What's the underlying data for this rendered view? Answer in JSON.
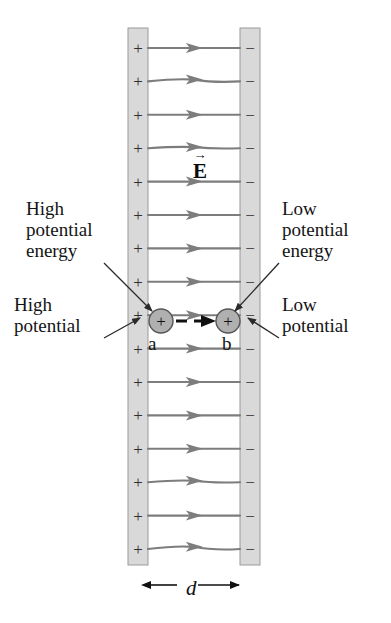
{
  "figure": {
    "width": 391,
    "height": 623,
    "background": "#ffffff"
  },
  "colors": {
    "plate_fill": "#d9d9d9",
    "plate_stroke": "#9a9a9a",
    "field_line": "#7d7d7d",
    "charge_fill": "#b0b0b0",
    "charge_stroke": "#555555",
    "leader_line": "#2a2a2a",
    "text": "#141414",
    "motion_arrow": "#111111"
  },
  "plates": {
    "left": {
      "name": "positive-plate",
      "x": 128,
      "y": 28,
      "width": 20,
      "height": 537,
      "sign": "+",
      "sign_count": 16
    },
    "right": {
      "name": "negative-plate",
      "x": 240,
      "y": 28,
      "width": 20,
      "height": 537,
      "sign": "−",
      "sign_count": 16
    }
  },
  "field": {
    "label": "E",
    "vector_accent": "→",
    "label_x": 193,
    "label_y": 152,
    "line_count": 16,
    "line_top": 48,
    "line_spacing": 33.4,
    "line_x_start": 148,
    "line_x_end": 240,
    "direction": "left-to-right"
  },
  "charges": [
    {
      "name": "charge-at-a",
      "sign": "+",
      "cx": 161,
      "cy": 321,
      "r": 12,
      "point_label": "a",
      "point_label_x": 148,
      "point_label_y": 333
    },
    {
      "name": "charge-at-b",
      "sign": "+",
      "cx": 228,
      "cy": 321,
      "r": 12,
      "point_label": "b",
      "point_label_x": 222,
      "point_label_y": 333
    }
  ],
  "motion_arrow": {
    "name": "displacement-arrow",
    "x1": 176,
    "x2": 214,
    "y": 321,
    "style": "dashed-with-arrowhead"
  },
  "annotations": [
    {
      "name": "high-potential-energy-label",
      "lines": [
        "High",
        "potential",
        "energy"
      ],
      "x": 26,
      "y": 198,
      "align": "left",
      "leader": {
        "x1": 104,
        "y1": 263,
        "x2": 152,
        "y2": 311
      }
    },
    {
      "name": "low-potential-energy-label",
      "lines": [
        "Low",
        "potential",
        "energy"
      ],
      "x": 282,
      "y": 198,
      "align": "left",
      "leader": {
        "x1": 279,
        "y1": 263,
        "x2": 235,
        "y2": 311
      }
    },
    {
      "name": "high-potential-label",
      "lines": [
        "High",
        "potential"
      ],
      "x": 14,
      "y": 294,
      "align": "left",
      "leader": {
        "x1": 104,
        "y1": 338,
        "x2": 140,
        "y2": 318
      }
    },
    {
      "name": "low-potential-label",
      "lines": [
        "Low",
        "potential"
      ],
      "x": 282,
      "y": 294,
      "align": "left",
      "leader": {
        "x1": 279,
        "y1": 338,
        "x2": 248,
        "y2": 318
      }
    }
  ],
  "dimension": {
    "name": "plate-separation",
    "label": "d",
    "x1": 150,
    "x2": 239,
    "y": 585,
    "label_x": 186,
    "label_y": 576
  }
}
